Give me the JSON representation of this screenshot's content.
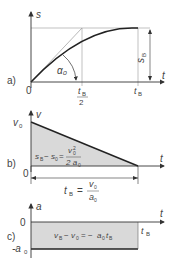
{
  "panel_a": {
    "label": "a)",
    "y_axis": "s",
    "x_axis": "t",
    "origin": "0",
    "angle": "α₀",
    "tick_half_num": "t",
    "tick_half_sub": "B",
    "tick_half_den": "2",
    "tick_end": "t",
    "tick_end_sub": "B",
    "dim": "s",
    "dim_sub": "B"
  },
  "panel_b": {
    "label": "b)",
    "y_axis": "v",
    "x_axis": "t",
    "origin": "0",
    "v0": "v",
    "v0_sub": "0",
    "area_formula": "s_B − s_0 = v₀² / 2a₀",
    "area_lhs": "s",
    "area_lhs2": "− s",
    "area_eq": "=",
    "area_num": "v",
    "area_den": "2 a",
    "dim_lhs": "t",
    "dim_sub": "B",
    "dim_eq": "=",
    "dim_num": "v",
    "dim_den": "a",
    "colors": {
      "fill": "#d9d9d9"
    }
  },
  "panel_c": {
    "label": "c)",
    "y_axis": "a",
    "x_axis": "t",
    "zero": "0",
    "neg_a0": "-a",
    "neg_a0_sub": "0",
    "tB": "t",
    "tB_sub": "B",
    "formula": "v_B − v_0 = − a_0 t_B",
    "colors": {
      "fill": "#d9d9d9"
    }
  }
}
